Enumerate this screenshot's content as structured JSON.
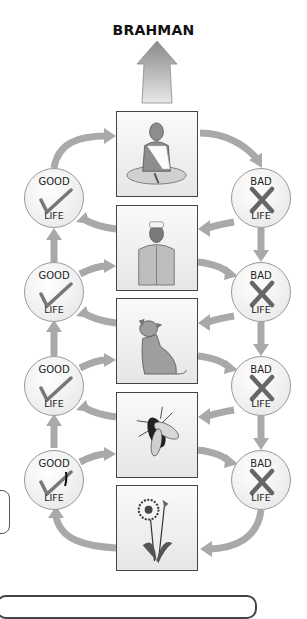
{
  "title": "BRAHMAN",
  "colors": {
    "arrow": "#a9a9a9",
    "frame_border": "#444444",
    "text": "#111111"
  },
  "stages": [
    {
      "name": "priest",
      "label": "Meditating priest"
    },
    {
      "name": "man",
      "label": "Man in cap"
    },
    {
      "name": "dog",
      "label": "Dog"
    },
    {
      "name": "fly",
      "label": "Fly"
    },
    {
      "name": "flower",
      "label": "Plant"
    }
  ],
  "good_circles": [
    {
      "top": "GOOD",
      "bottom": "LIFE",
      "icon": "check-icon"
    },
    {
      "top": "GOOD",
      "bottom": "LIFE",
      "icon": "check-icon"
    },
    {
      "top": "GOOD",
      "bottom": "LIFE",
      "icon": "check-icon"
    },
    {
      "top": "GOOD",
      "bottom": "LIFE",
      "icon": "check-icon"
    }
  ],
  "bad_circles": [
    {
      "top": "BAD",
      "bottom": "LIFE",
      "icon": "cross-icon"
    },
    {
      "top": "BAD",
      "bottom": "LIFE",
      "icon": "cross-icon"
    },
    {
      "top": "BAD",
      "bottom": "LIFE",
      "icon": "cross-icon"
    },
    {
      "top": "BAD",
      "bottom": "LIFE",
      "icon": "cross-icon"
    }
  ]
}
